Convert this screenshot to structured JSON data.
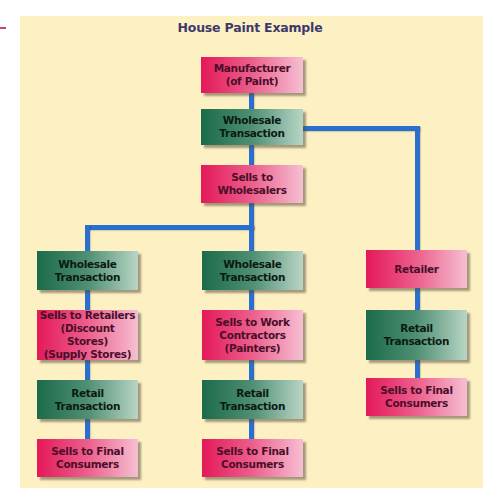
{
  "diagram": {
    "title": "House Paint Example",
    "colors": {
      "background_panel": "#fdf1c4",
      "connector": "#2a6fd0",
      "entity_node": "#e4195a",
      "transaction_node": "#1b6b4a",
      "title_text": "#3d3a6b"
    },
    "nodes": {
      "manufacturer": {
        "label": "Manufacturer\n(of Paint)",
        "type": "entity"
      },
      "wholesale_top": {
        "label": "Wholesale\nTransaction",
        "type": "transaction"
      },
      "sells_wholesalers": {
        "label": "Sells to\nWholesalers",
        "type": "entity"
      },
      "left_wholesale": {
        "label": "Wholesale\nTransaction",
        "type": "transaction"
      },
      "left_sells_retailers": {
        "label": "Sells to Retailers\n(Discount Stores)\n(Supply Stores)",
        "type": "entity"
      },
      "left_retail": {
        "label": "Retail\nTransaction",
        "type": "transaction"
      },
      "left_final": {
        "label": "Sells to Final\nConsumers",
        "type": "entity"
      },
      "mid_wholesale": {
        "label": "Wholesale\nTransaction",
        "type": "transaction"
      },
      "mid_sells_contractors": {
        "label": "Sells to Work\nContractors\n(Painters)",
        "type": "entity"
      },
      "mid_retail": {
        "label": "Retail\nTransaction",
        "type": "transaction"
      },
      "mid_final": {
        "label": "Sells to Final\nConsumers",
        "type": "entity"
      },
      "right_retailer": {
        "label": "Retailer",
        "type": "entity"
      },
      "right_retail": {
        "label": "Retail\nTransaction",
        "type": "transaction"
      },
      "right_final": {
        "label": "Sells to Final\nConsumers",
        "type": "entity"
      }
    },
    "edges": [
      [
        "manufacturer",
        "wholesale_top"
      ],
      [
        "wholesale_top",
        "sells_wholesalers"
      ],
      [
        "wholesale_top",
        "right_retailer"
      ],
      [
        "sells_wholesalers",
        "left_wholesale"
      ],
      [
        "sells_wholesalers",
        "mid_wholesale"
      ],
      [
        "left_wholesale",
        "left_sells_retailers"
      ],
      [
        "left_sells_retailers",
        "left_retail"
      ],
      [
        "left_retail",
        "left_final"
      ],
      [
        "mid_wholesale",
        "mid_sells_contractors"
      ],
      [
        "mid_sells_contractors",
        "mid_retail"
      ],
      [
        "mid_retail",
        "mid_final"
      ],
      [
        "right_retailer",
        "right_retail"
      ],
      [
        "right_retail",
        "right_final"
      ]
    ]
  }
}
